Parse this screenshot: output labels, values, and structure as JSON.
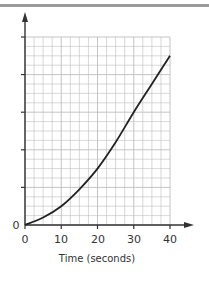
{
  "chart_data": {
    "type": "line",
    "title": "",
    "xlabel": "Time (seconds)",
    "ylabel": "",
    "xlim": [
      0,
      40
    ],
    "ylim": [
      0,
      20
    ],
    "x_ticks": [
      "0",
      "10",
      "20",
      "30",
      "40"
    ],
    "y_ticks": [
      "0"
    ],
    "y_unlabeled_major_ticks": 5,
    "grid": true,
    "grid_columns": 16,
    "grid_rows": 20,
    "series": [
      {
        "name": "curve",
        "x": [
          0,
          5,
          10,
          15,
          20,
          25,
          30,
          35,
          40
        ],
        "values": [
          0,
          0.8,
          2,
          3.8,
          6,
          8.8,
          12,
          15,
          18
        ]
      }
    ],
    "legend": null
  },
  "labels": {
    "origin_y": "0",
    "x0": "0",
    "x10": "10",
    "x20": "20",
    "x30": "30",
    "x40": "40",
    "x_title": "Time (seconds)"
  },
  "colors": {
    "grid": "#bdbdbd",
    "axis": "#333333",
    "curve": "#222222",
    "top_bar": "#9a9a9a"
  }
}
